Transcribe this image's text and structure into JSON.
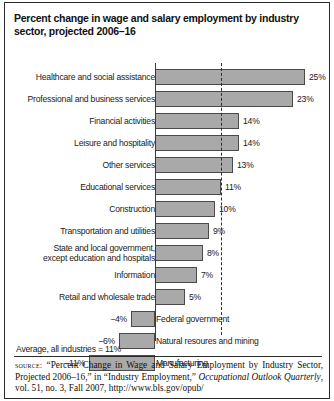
{
  "title": "Percent change in wage and salary employment by industry sector, projected 2006–16",
  "average_note": "Average, all industries = 11%",
  "source": {
    "label": "source:",
    "text_1": " “Percent Change in Wage and Salary Employment by Industry Sector, Projected 2006–16,” in “Industry Employment,” ",
    "italic_1": "Occupational Outlook Quarterly",
    "text_2": ", vol. 51, no. 3, Fall 2007, http://www.bls.gov/opub/"
  },
  "chart_data": {
    "type": "bar",
    "orientation": "horizontal",
    "title": "Percent change in wage and salary employment by industry sector, projected 2006–16",
    "xlabel": "",
    "ylabel": "",
    "unit": "percent",
    "xlim": [
      -11,
      25
    ],
    "grid": false,
    "legend": false,
    "zero_axis": true,
    "annotations": [
      {
        "name": "average-line",
        "type": "dashed-vertical",
        "value": 11,
        "label": "Average, all industries = 11%"
      }
    ],
    "categories": [
      "Healthcare and social assistance",
      "Professional and business services",
      "Financial activities",
      "Leisure and hospitality",
      "Other services",
      "Educational services",
      "Construction",
      "Transportation and utilities",
      "State and local government, except education and hospitals",
      "Information",
      "Retail and wholesale trade",
      "Federal government",
      "Natural resoures and mining",
      "Manufacturing"
    ],
    "values": [
      25,
      23,
      14,
      14,
      13,
      11,
      10,
      9,
      8,
      7,
      5,
      -4,
      -6,
      -11
    ],
    "value_labels": [
      "25%",
      "23%",
      "14%",
      "14%",
      "13%",
      "11%",
      "10%",
      "9%",
      "8%",
      "7%",
      "5%",
      "−4%",
      "−6%",
      "−11%"
    ]
  },
  "rows": [
    {
      "label": "Healthcare and social assistance",
      "label_line1": "Healthcare and social assistance",
      "label_line2": "",
      "value": 25,
      "value_label": "25%"
    },
    {
      "label": "Professional and business services",
      "label_line1": "Professional and business services",
      "label_line2": "",
      "value": 23,
      "value_label": "23%"
    },
    {
      "label": "Financial activities",
      "label_line1": "Financial activities",
      "label_line2": "",
      "value": 14,
      "value_label": "14%"
    },
    {
      "label": "Leisure and hospitality",
      "label_line1": "Leisure and hospitality",
      "label_line2": "",
      "value": 14,
      "value_label": "14%"
    },
    {
      "label": "Other services",
      "label_line1": "Other services",
      "label_line2": "",
      "value": 13,
      "value_label": "13%"
    },
    {
      "label": "Educational services",
      "label_line1": "Educational services",
      "label_line2": "",
      "value": 11,
      "value_label": "11%"
    },
    {
      "label": "Construction",
      "label_line1": "Construction",
      "label_line2": "",
      "value": 10,
      "value_label": "10%"
    },
    {
      "label": "Transportation and utilities",
      "label_line1": "Transportation and utilities",
      "label_line2": "",
      "value": 9,
      "value_label": "9%"
    },
    {
      "label": "State and local government, except education and hospitals",
      "label_line1": "State and local government,",
      "label_line2": "except education and hospitals",
      "value": 8,
      "value_label": "8%"
    },
    {
      "label": "Information",
      "label_line1": "Information",
      "label_line2": "",
      "value": 7,
      "value_label": "7%"
    },
    {
      "label": "Retail and wholesale trade",
      "label_line1": "Retail and wholesale trade",
      "label_line2": "",
      "value": 5,
      "value_label": "5%"
    },
    {
      "label": "Federal government",
      "label_line1": "Federal government",
      "label_line2": "",
      "value": -4,
      "value_label": "−4%"
    },
    {
      "label": "Natural resoures and mining",
      "label_line1": "Natural resoures and mining",
      "label_line2": "",
      "value": -6,
      "value_label": "−6%"
    },
    {
      "label": "Manufacturing",
      "label_line1": "Manufacturing",
      "label_line2": "",
      "value": -11,
      "value_label": "−11%"
    }
  ]
}
